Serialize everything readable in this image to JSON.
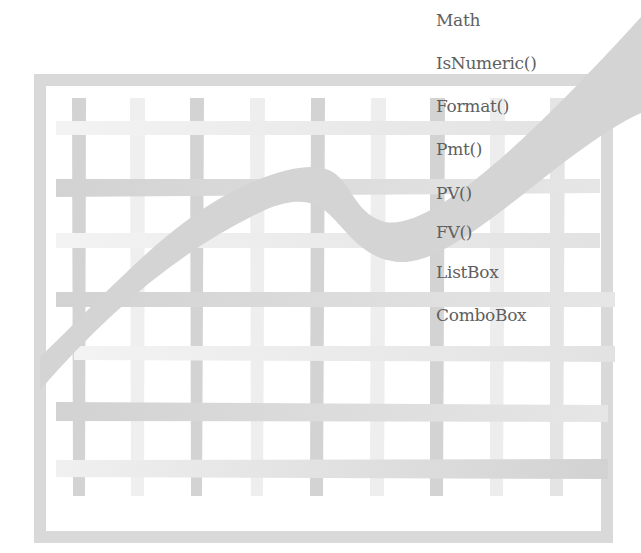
{
  "menu": {
    "items": [
      {
        "label": "Math",
        "top": 10
      },
      {
        "label": "IsNumeric()",
        "top": 53
      },
      {
        "label": "Format()",
        "top": 96
      },
      {
        "label": "Pmt()",
        "top": 139
      },
      {
        "label": "PV()",
        "top": 183
      },
      {
        "label": "FV()",
        "top": 222
      },
      {
        "label": "ListBox",
        "top": 262
      },
      {
        "label": "ComboBox",
        "top": 305
      }
    ]
  },
  "colors": {
    "frame": "#d9d9d9",
    "bar_dark": "#d3d3d3",
    "bar_light": "#ececec",
    "curve": "#d4d4d4",
    "text": "#5f5f5f"
  }
}
